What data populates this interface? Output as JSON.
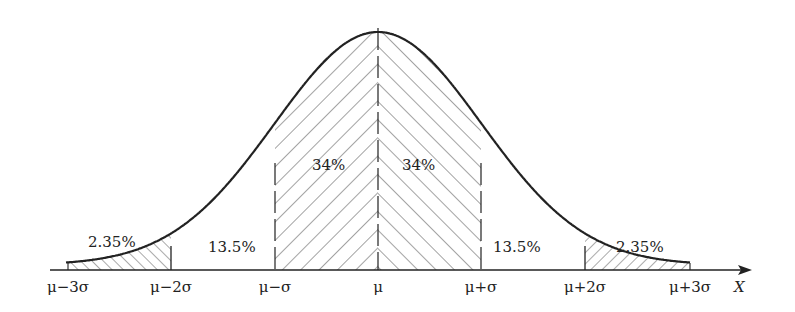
{
  "chart_data": {
    "type": "area",
    "xlabel": "X",
    "ylabel": "",
    "tick_labels": [
      "μ−3σ",
      "μ−2σ",
      "μ−σ",
      "μ",
      "μ+σ",
      "μ+2σ",
      "μ+3σ"
    ],
    "tick_positions_sigma": [
      -3,
      -2,
      -1,
      0,
      1,
      2,
      3
    ],
    "regions": [
      {
        "from": -3,
        "to": -2,
        "label": "2.35%",
        "percent": 2.35,
        "hatched": true,
        "hatch": "backslash"
      },
      {
        "from": -2,
        "to": -1,
        "label": "13.5%",
        "percent": 13.5,
        "hatched": false
      },
      {
        "from": -1,
        "to": 0,
        "label": "34%",
        "percent": 34,
        "hatched": true,
        "hatch": "slash"
      },
      {
        "from": 0,
        "to": 1,
        "label": "34%",
        "percent": 34,
        "hatched": true,
        "hatch": "backslash"
      },
      {
        "from": 1,
        "to": 2,
        "label": "13.5%",
        "percent": 13.5,
        "hatched": false
      },
      {
        "from": 2,
        "to": 3,
        "label": "2.35%",
        "percent": 2.35,
        "hatched": true,
        "hatch": "slash"
      }
    ],
    "grid": false,
    "legend": null
  },
  "labels": {
    "x_axis": "X",
    "ticks": [
      "μ−3σ",
      "μ−2σ",
      "μ−σ",
      "μ",
      "μ+σ",
      "μ+2σ",
      "μ+3σ"
    ],
    "region_left_tail": "2.35%",
    "region_left_mid": "13.5%",
    "region_left_center": "34%",
    "region_right_center": "34%",
    "region_right_mid": "13.5%",
    "region_right_tail": "2.35%"
  },
  "colors": {
    "line": "#222222",
    "hatch": "#555555",
    "background": "#ffffff"
  }
}
